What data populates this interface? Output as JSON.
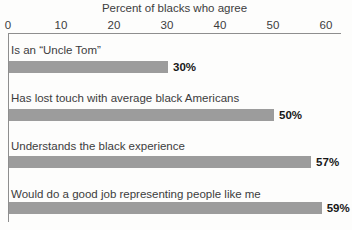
{
  "chart_data": {
    "type": "bar",
    "orientation": "horizontal",
    "title": "Percent of blacks who agree",
    "categories": [
      "Is an “Uncle Tom”",
      "Has lost touch with average black Americans",
      "Understands the black experience",
      "Would do a good job representing people like me"
    ],
    "values": [
      30,
      50,
      57,
      59
    ],
    "value_labels": [
      "30%",
      "50%",
      "57%",
      "59%"
    ],
    "xlim": [
      0,
      60
    ],
    "x_ticks": [
      "0",
      "10",
      "20",
      "30",
      "40",
      "50",
      "60"
    ],
    "grid": "off",
    "legend": "none",
    "bar_color": "#9c9c9c",
    "axis_color": "#8e8e8e",
    "text_color": "#3c3c3c",
    "value_label_color": "#171717"
  }
}
